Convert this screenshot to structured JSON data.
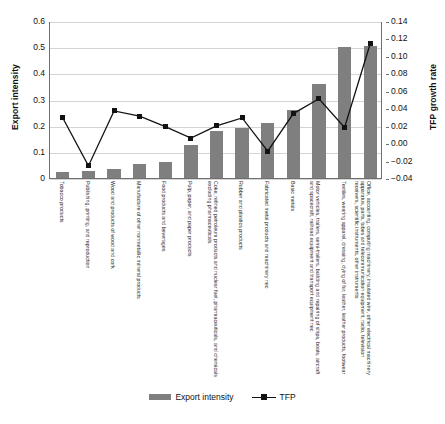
{
  "chart_data": {
    "type": "bar",
    "title": "",
    "xlabel": "",
    "ylabel": "Export intensity",
    "y2label": "TFP growth rate",
    "ylim": [
      0,
      0.6
    ],
    "y2lim": [
      -0.04,
      0.14
    ],
    "grid": true,
    "legend_position": "bottom",
    "yticks": [
      "0",
      "0.1",
      "0.2",
      "0.3",
      "0.4",
      "0.5",
      "0.6"
    ],
    "y2ticks": [
      "-0.04",
      "-0.02",
      "0.00",
      "0.02",
      "0.04",
      "0.06",
      "0.08",
      "0.10",
      "0.12",
      "0.14"
    ],
    "categories": [
      "Tobacco products",
      "Publishing, printing, and reproduction",
      "Wood and products of wood and cork",
      "Manufacture of other nonmetallic mineral products",
      "Food products and beverages",
      "Pulp, paper, and paper products",
      "Coke, refined petroleum products and nuclear fuel, pharmaceuticals, and chemicals excluding pharmaceuticals",
      "Rubber and plastics products",
      "Fabricated metal products and machinery nec",
      "Basic metals",
      "Motor vehicles, trailers, semi-trailers, building and repairing of ships, boats, aircraft and spacecraft, railroad equipment and transport equipment nec",
      "Textiles, wearing apparel, dressing, dying of fur, leather, leather products, footwear",
      "Office, accounting, computing machinery, insulated wire, other electrical machinery apparatus, parts, tubes and telecommunication equipment, radio, television receivers, scientific instruments, other instruments"
    ],
    "series": [
      {
        "name": "Export intensity",
        "axis": "left",
        "color": "#7f7f7f",
        "type": "bar",
        "values": [
          0.024,
          0.026,
          0.036,
          0.052,
          0.062,
          0.128,
          0.178,
          0.191,
          0.212,
          0.26,
          0.361,
          0.502,
          0.503
        ]
      },
      {
        "name": "TFP",
        "axis": "right",
        "color": "#121212",
        "type": "line",
        "values": [
          0.03,
          -0.025,
          0.038,
          0.032,
          0.02,
          0.007,
          0.021,
          0.03,
          -0.008,
          0.035,
          0.052,
          0.019,
          0.115
        ]
      }
    ]
  },
  "legend": {
    "items": [
      {
        "label": "Export intensity",
        "marker": "bar-swatch"
      },
      {
        "label": "TFP",
        "marker": "line-square-marker"
      }
    ]
  }
}
